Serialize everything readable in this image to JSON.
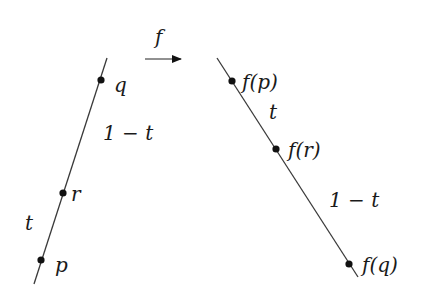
{
  "diagram": {
    "map_label": "f",
    "left_line": {
      "points": [
        {
          "id": "q",
          "label": "q",
          "x": 101,
          "y": 80,
          "label_x": 114,
          "label_y": 92
        },
        {
          "id": "r",
          "label": "r",
          "x": 63,
          "y": 193,
          "label_x": 71,
          "label_y": 201
        },
        {
          "id": "p",
          "label": "p",
          "x": 41,
          "y": 260,
          "label_x": 55,
          "label_y": 272
        }
      ],
      "segment_labels": [
        {
          "text": "1 − t",
          "x": 103,
          "y": 140
        },
        {
          "text": "t",
          "x": 25,
          "y": 230
        }
      ]
    },
    "right_line": {
      "points": [
        {
          "id": "fp",
          "label": "f(p)",
          "x": 232,
          "y": 81,
          "label_x": 244,
          "label_y": 88
        },
        {
          "id": "fr",
          "label": "f(r)",
          "x": 276,
          "y": 149,
          "label_x": 290,
          "label_y": 156
        },
        {
          "id": "fq",
          "label": "f(q)",
          "x": 349,
          "y": 264,
          "label_x": 364,
          "label_y": 271
        }
      ],
      "segment_labels": [
        {
          "text": "t",
          "x": 269,
          "y": 119
        },
        {
          "text": "1 − t",
          "x": 329,
          "y": 207
        }
      ]
    },
    "colors": {
      "line": "#3a3a3a",
      "point": "#111111",
      "text": "#1a1a1a"
    }
  }
}
